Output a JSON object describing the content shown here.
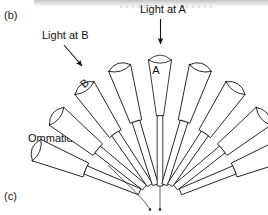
{
  "figure": {
    "panel_label": "(b)",
    "next_panel_label": "(c)",
    "caption_terms": {
      "ommatidia": "Ommatidia"
    }
  },
  "annotations": {
    "light_a": {
      "text": "Light at A",
      "arrow": "vertical-down-arrow",
      "target_letter": "A"
    },
    "light_b": {
      "text": "Light at B",
      "arrow": "diagonal-down-right-arrow",
      "target_letter": "B"
    },
    "structure_label": {
      "text": "Ommatidia",
      "points_to": "ommatidium-body"
    }
  },
  "diagram": {
    "type": "compound-eye-ommatidia-fan",
    "ommatidia_count": 9,
    "labeled_ommatidia": [
      {
        "id": "B",
        "index": 1,
        "letter": "B"
      },
      {
        "id": "A",
        "index": 4,
        "letter": "A"
      }
    ],
    "colors": {
      "stroke": "#1a1a1a",
      "fill": "#ffffff",
      "background": "#ffffff",
      "scan_artifact": "#cfcfcf"
    },
    "ommatidia": [
      {
        "angle": -68,
        "label": ""
      },
      {
        "angle": -51,
        "label": "B"
      },
      {
        "angle": -34,
        "label": ""
      },
      {
        "angle": -17,
        "label": ""
      },
      {
        "angle": 0,
        "label": "A"
      },
      {
        "angle": 17,
        "label": ""
      },
      {
        "angle": 34,
        "label": ""
      },
      {
        "angle": 51,
        "label": ""
      },
      {
        "angle": 68,
        "label": ""
      }
    ]
  }
}
